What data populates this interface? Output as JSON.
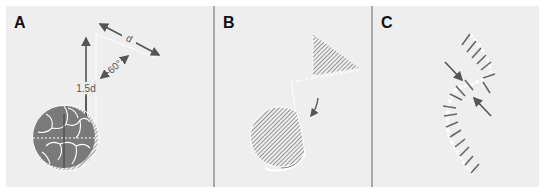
{
  "figure": {
    "colors": {
      "background": "#ffffff",
      "panel": "#eeeeee",
      "divider": "#a8a8a8",
      "shape_fill": "#7a7a7a",
      "hatch": "#6e6e6e",
      "arrow": "#555555",
      "dashed": "#ffffff",
      "label": "#111111"
    },
    "panels": [
      {
        "id": "A",
        "label": "A",
        "annotations": {
          "distance_label": "d",
          "height_label": "1.5d",
          "angle_label": "60°"
        },
        "elements": [
          "vertical-arrow",
          "diagonal-distance-arrow",
          "angle-arrow",
          "sphere-with-cracks",
          "dashed-center-line"
        ]
      },
      {
        "id": "B",
        "label": "B",
        "elements": [
          "hatched-triangle",
          "hatched-circle",
          "curved-arrow",
          "dashed-outline"
        ]
      },
      {
        "id": "C",
        "label": "C",
        "elements": [
          "arc-of-tick-marks",
          "inward-arrows",
          "dashed-arc"
        ]
      }
    ]
  }
}
